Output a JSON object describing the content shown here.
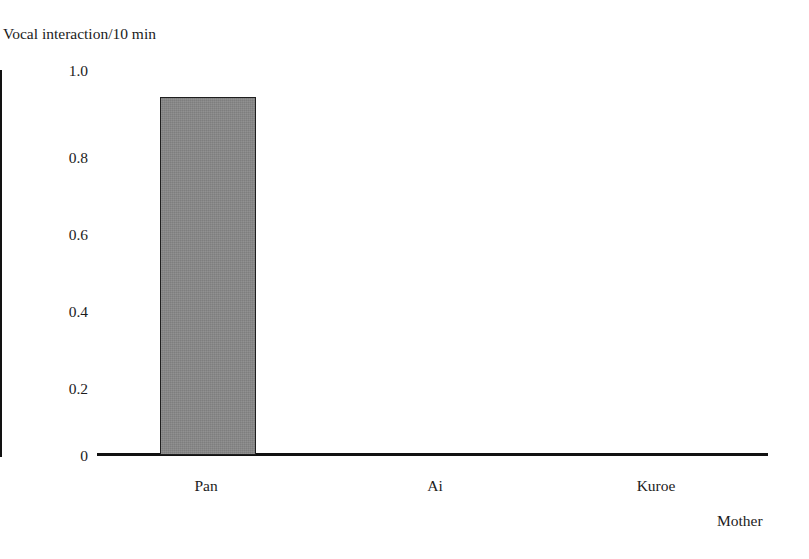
{
  "chart_data": {
    "type": "bar",
    "title": "",
    "ylabel": "Vocal interaction/10 min",
    "xlabel": "Mother",
    "categories": [
      "Pan",
      "Ai",
      "Kuroe"
    ],
    "values": [
      0.93,
      0,
      0
    ],
    "series": [
      {
        "name": "Vocal interaction/10 min",
        "values": [
          0.93,
          0,
          0
        ]
      }
    ],
    "ylim": [
      0,
      1.0
    ],
    "y_ticks": [
      0,
      0.2,
      0.4,
      0.6,
      0.8,
      1.0
    ],
    "y_tick_labels": [
      "0",
      "0.2",
      "0.4",
      "0.6",
      "0.8",
      "1.0"
    ],
    "grid": false,
    "legend": null,
    "legend_position": "none",
    "annotations": [],
    "bar_fill_color": "#878787",
    "bar_edge_color": "#1f1f1f",
    "axis_color": "#121212",
    "background_color": "#ffffff"
  },
  "figure": {
    "y_axis_caption": "Vocal interaction/10 min",
    "x_axis_caption": "Mother"
  }
}
